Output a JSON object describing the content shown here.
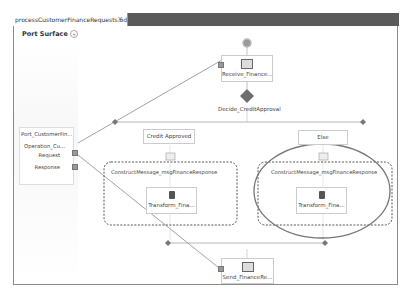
{
  "tab": {
    "title": "processCustomerFinanceRequests.odx",
    "close": "×"
  },
  "port_surface": {
    "label": "Port Surface",
    "collapse_icon": "«"
  },
  "port": {
    "name": "Port_CustomerFin...",
    "operation": "Operation_Cu...",
    "request": "Request",
    "response": "Response"
  },
  "shapes": {
    "receive": "Receive_Finance...",
    "decide": "Decide_CreditApproval",
    "branch_left": "Credit Approved",
    "branch_right": "Else",
    "construct_left": "ConstructMessage_msgFinanceResponse",
    "construct_right": "ConstructMessage_msgFinanceResponse",
    "transform_left": "Transform_Fina...",
    "transform_right": "Transform_Fina...",
    "send": "Send_FinanceRe..."
  },
  "colors": {
    "tabbar": "#5a5a5a",
    "connector": "#8a8a8a",
    "highlight_ellipse": "#777777",
    "diamond": "#6e6e6e"
  }
}
